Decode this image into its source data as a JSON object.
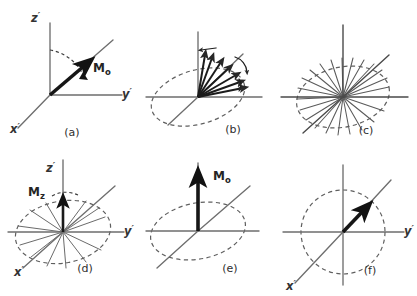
{
  "figure": {
    "background_color": "#ffffff",
    "ink_color": "#2b2b2b",
    "axis_color": "#6e6e6e",
    "vector_color": "#161616",
    "dashed_color": "#5f5f5f",
    "width": 417,
    "height": 296,
    "panel_count": 6
  },
  "labels": {
    "z_axis": "z",
    "y_axis": "y",
    "x_axis": "x",
    "prime": "′",
    "m_zero_base": "M",
    "m_zero_sub": "o",
    "m_z_base": "M",
    "m_z_sub": "z"
  },
  "panels": [
    {
      "id": "a",
      "letter": "(a)",
      "caption_letter": "a",
      "description": "Magnetization tipped into the transverse plane; M0 at 45 degrees with dashed flip arc from z axis",
      "axes": [
        "z",
        "y",
        "x"
      ],
      "axis_labels_shown": [
        "z",
        "y",
        "x"
      ],
      "vector_label": "Mo",
      "has_dashed_arc": true,
      "has_dashed_ellipse": false,
      "spoke_count": 0
    },
    {
      "id": "b",
      "letter": "(b)",
      "caption_letter": "b",
      "description": "Spins begin to dephase; fan of isochromat vectors with small curved arrows showing divergence",
      "axes": [
        "z",
        "y",
        "x"
      ],
      "axis_labels_shown": [],
      "vector_label": "",
      "has_dashed_arc": false,
      "has_dashed_ellipse": true,
      "spoke_count": 7
    },
    {
      "id": "c",
      "letter": "(c)",
      "caption_letter": "c",
      "description": "Complete dephasing; isochromats spread uniformly around the transverse plane",
      "axes": [
        "z",
        "y",
        "x"
      ],
      "axis_labels_shown": [],
      "vector_label": "",
      "has_dashed_arc": false,
      "has_dashed_ellipse": true,
      "spoke_count": 22
    },
    {
      "id": "d",
      "letter": "(d)",
      "caption_letter": "d",
      "description": "Longitudinal recovery begins; Mz grows along z while transverse components remain dephased",
      "axes": [
        "z",
        "y",
        "x"
      ],
      "axis_labels_shown": [
        "z",
        "y",
        "x"
      ],
      "vector_label": "Mz",
      "has_dashed_arc": false,
      "has_dashed_ellipse": true,
      "spoke_count": 12
    },
    {
      "id": "e",
      "letter": "(e)",
      "caption_letter": "e",
      "description": "Full longitudinal recovery; M0 restored along the z axis",
      "axes": [
        "z",
        "y",
        "x"
      ],
      "axis_labels_shown": [],
      "vector_label": "Mo",
      "has_dashed_arc": false,
      "has_dashed_ellipse": true,
      "spoke_count": 0
    },
    {
      "id": "f",
      "letter": "(f)",
      "caption_letter": "f",
      "description": "View showing a short residual vector along the x axis within a dashed circle",
      "axes": [
        "z",
        "y",
        "x"
      ],
      "axis_labels_shown": [
        "y",
        "x"
      ],
      "vector_label": "",
      "has_dashed_arc": false,
      "has_dashed_ellipse": true,
      "spoke_count": 0
    }
  ]
}
